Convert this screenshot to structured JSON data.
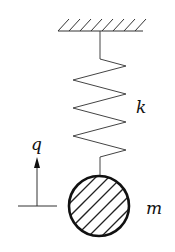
{
  "diagram": {
    "type": "spring-mass system",
    "labels": {
      "spring_constant": "k",
      "mass": "m",
      "displacement": "q"
    },
    "colors": {
      "stroke": "#222222",
      "background": "#ffffff"
    },
    "elements": [
      {
        "name": "fixed-support",
        "description": "hatched ceiling"
      },
      {
        "name": "spring",
        "label": "k"
      },
      {
        "name": "mass",
        "label": "m",
        "shape": "hatched circle"
      },
      {
        "name": "displacement-arrow",
        "label": "q",
        "direction": "up"
      }
    ]
  }
}
